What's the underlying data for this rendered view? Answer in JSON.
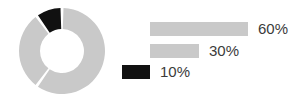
{
  "chart_data": {
    "type": "pie",
    "variant": "donut",
    "title": "",
    "subtitle": "",
    "xlabel": "",
    "ylabel": "",
    "grid": false,
    "legend_position": "right",
    "background_color": "#ffffff",
    "categories": [
      "60%",
      "30%",
      "10%"
    ],
    "values": [
      60,
      30,
      10
    ],
    "value_labels": [
      "60%",
      "30%",
      "10%"
    ],
    "colors": [
      "#c9c9c9",
      "#c9c9c9",
      "#111111"
    ],
    "slices": [
      {
        "label": "60%",
        "value": 60,
        "color": "#c9c9c9"
      },
      {
        "label": "30%",
        "value": 30,
        "color": "#c9c9c9"
      },
      {
        "label": "10%",
        "value": 10,
        "color": "#111111"
      }
    ],
    "legend": [
      {
        "label": "60%",
        "value": 60,
        "color": "#c9c9c9",
        "swatch": "bar"
      },
      {
        "label": "30%",
        "value": 30,
        "color": "#c9c9c9",
        "swatch": "bar"
      },
      {
        "label": "10%",
        "value": 10,
        "color": "#111111",
        "swatch": "square"
      }
    ]
  },
  "donut": {
    "center_x": 62,
    "center_y": 51,
    "outer_radius": 43,
    "inner_radius": 22,
    "gap_degrees": 4,
    "start_angle_degrees": 0
  },
  "legend_layout": {
    "bar_left": 150,
    "bar_max_width": 98,
    "label_gap": 10,
    "square_left": 122,
    "square_width": 28,
    "square_label_left": 160
  }
}
